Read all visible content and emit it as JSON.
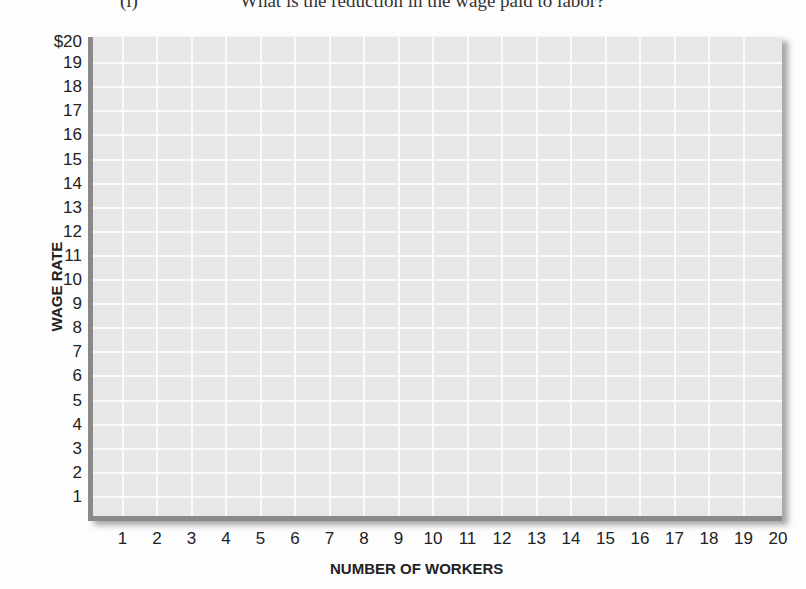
{
  "question": {
    "number": "(i)",
    "text": "What is the reduction in the wage paid to labor?"
  },
  "chart_data": {
    "type": "line",
    "title": "",
    "xlabel": "NUMBER OF WORKERS",
    "ylabel": "WAGE RATE",
    "x_ticks": [
      "1",
      "2",
      "3",
      "4",
      "5",
      "6",
      "7",
      "8",
      "9",
      "10",
      "11",
      "12",
      "13",
      "14",
      "15",
      "16",
      "17",
      "18",
      "19",
      "20"
    ],
    "y_ticks": [
      "1",
      "2",
      "3",
      "4",
      "5",
      "6",
      "7",
      "8",
      "9",
      "10",
      "11",
      "12",
      "13",
      "14",
      "15",
      "16",
      "17",
      "18",
      "19",
      "$20"
    ],
    "xlim": [
      0,
      20
    ],
    "ylim": [
      0,
      20
    ],
    "grid": true,
    "series": [],
    "colors": {
      "plot_bg": "#e7e7e7",
      "grid": "#fafafa",
      "axis": "#8a8a8a"
    }
  }
}
